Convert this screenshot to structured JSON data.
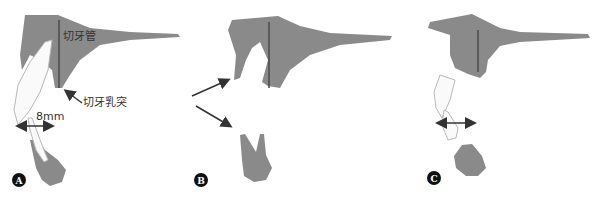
{
  "panels": [
    {
      "id": "A",
      "badge": "A"
    },
    {
      "id": "B",
      "badge": "B"
    },
    {
      "id": "C",
      "badge": "C"
    }
  ],
  "labels": {
    "incisive_canal": "切牙管",
    "incisive_papilla": "切牙乳突",
    "distance": "8mm"
  },
  "colors": {
    "bone": "#8a8a8a",
    "bone_dark": "#6f6f6f",
    "tooth": "#fafafa",
    "tooth_outline": "#b8b8b8",
    "arrow": "#333333",
    "badge": "#111111",
    "canal_line": "#4a4a4a"
  }
}
